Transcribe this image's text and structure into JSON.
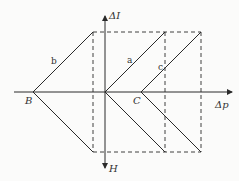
{
  "diagram": {
    "axes": {
      "horizontal_label": "Δp",
      "vertical_up_label": "ΔI",
      "vertical_down_label": "H"
    },
    "points": {
      "B": "B",
      "C": "C"
    },
    "lines": {
      "a": "a",
      "b": "b",
      "c": "c"
    },
    "colors": {
      "line": "#2a2a2a",
      "background": "#fbfbfa"
    }
  }
}
